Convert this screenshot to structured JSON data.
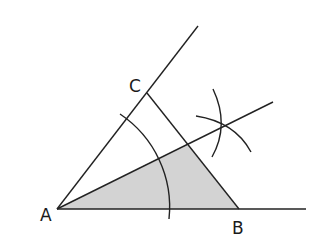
{
  "diagram": {
    "labels": {
      "A": "A",
      "B": "B",
      "C": "C"
    },
    "points": {
      "A": [
        57,
        209
      ],
      "B": [
        239,
        209
      ],
      "C": [
        147,
        93
      ],
      "bisector_arc_intersection": [
        224,
        126
      ],
      "bisector_cb_intersection": [
        188,
        145
      ]
    },
    "colors": {
      "line": "#222222",
      "shade": "#d3d3d3",
      "background": "#ffffff"
    },
    "shaded_region": "triangle A, B, bisector∩CB"
  }
}
